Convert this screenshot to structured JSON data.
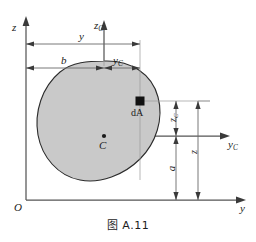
{
  "figure": {
    "caption": "图 A.11",
    "colors": {
      "shape_fill": "#c9c9c9",
      "shape_stroke": "#2b2b2b",
      "axis": "#4a4a4a",
      "dimension": "#6a6a6a",
      "marker": "#111111",
      "background": "#ffffff"
    }
  },
  "axes": {
    "origin_label": "O",
    "global_vertical_label": "z",
    "global_horizontal_label": "y",
    "centroid_vertical_label": "z",
    "centroid_vertical_sub": "C",
    "centroid_horizontal_label": "y",
    "centroid_horizontal_sub": "C"
  },
  "points": {
    "centroid_label": "C",
    "element_label": "dA"
  },
  "dimensions": {
    "horizontal": [
      {
        "name": "y-total",
        "label": "y",
        "sub": ""
      },
      {
        "name": "b",
        "label": "b",
        "sub": ""
      },
      {
        "name": "y-centroidal",
        "label": "y",
        "sub": "C"
      }
    ],
    "vertical": [
      {
        "name": "z-centroidal",
        "label": "z",
        "sub": "C"
      },
      {
        "name": "a",
        "label": "a",
        "sub": ""
      },
      {
        "name": "z-total",
        "label": "z",
        "sub": ""
      }
    ]
  }
}
